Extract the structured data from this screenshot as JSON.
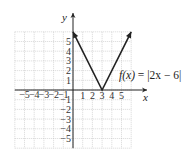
{
  "chart_data": {
    "type": "line",
    "title": "",
    "function_label": "f(x) = |2x − 6|",
    "xlabel": "x",
    "ylabel": "y",
    "xlim": [
      -6,
      6
    ],
    "ylim": [
      -6,
      6
    ],
    "grid": true,
    "x_tick_labels": [
      "−5",
      "−4",
      "−3",
      "−2",
      "−1",
      "1",
      "2",
      "3",
      "4",
      "5"
    ],
    "y_tick_labels": [
      "5",
      "4",
      "3",
      "2",
      "1",
      "−1",
      "−2",
      "−3",
      "−4",
      "−5"
    ],
    "series": [
      {
        "name": "f(x) = |2x − 6|",
        "x": [
          0,
          3,
          6
        ],
        "y": [
          6,
          0,
          6
        ],
        "arrows_at_ends": true,
        "color": "#222222"
      }
    ],
    "vertex": {
      "x": 3,
      "y": 0
    }
  },
  "labels": {
    "x_axis": "x",
    "y_axis": "y",
    "equation_fx": "f(x)",
    "equation_eq": " = |2x − 6|"
  },
  "colors": {
    "grid": "#bdbdbd",
    "axis": "#222222",
    "curve": "#222222"
  }
}
